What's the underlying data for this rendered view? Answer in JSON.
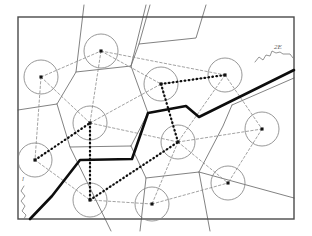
{
  "figure": {
    "kind": "geometric-diagram",
    "width": 312,
    "height": 236,
    "background_color": "#ffffff",
    "frame": {
      "label": "bounding-frame",
      "x": 18,
      "y": 17,
      "width": 276,
      "height": 202,
      "stroke_color": "#4a4a4a"
    },
    "styles": {
      "voronoi_edge_color": "#6b6b6b",
      "delaunay_edge_color": "#8a8a8a",
      "circle_color": "#7d7d7d",
      "node_color": "#111111",
      "thick_path_color": "#0d0d0d"
    },
    "nodes": [
      {
        "id": "n1",
        "label": "node-upper-left",
        "x": 41,
        "y": 77,
        "r": 17
      },
      {
        "id": "n2",
        "label": "node-top",
        "x": 101,
        "y": 51,
        "r": 17
      },
      {
        "id": "n3",
        "label": "node-mid-left",
        "x": 90,
        "y": 123,
        "r": 17
      },
      {
        "id": "n4",
        "label": "node-upper-center",
        "x": 161,
        "y": 84,
        "r": 17
      },
      {
        "id": "n5",
        "label": "node-upper-right",
        "x": 225,
        "y": 75,
        "r": 17
      },
      {
        "id": "n6",
        "label": "node-center",
        "x": 178,
        "y": 142,
        "r": 17
      },
      {
        "id": "n7",
        "label": "node-far-right",
        "x": 262,
        "y": 129,
        "r": 17
      },
      {
        "id": "n8",
        "label": "node-left-lower",
        "x": 35,
        "y": 160,
        "r": 17
      },
      {
        "id": "n9",
        "label": "node-bottom-left",
        "x": 90,
        "y": 200,
        "r": 17
      },
      {
        "id": "n10",
        "label": "node-bottom-center",
        "x": 152,
        "y": 204,
        "r": 17
      },
      {
        "id": "n11",
        "label": "node-lower-right",
        "x": 228,
        "y": 183,
        "r": 17
      }
    ],
    "delaunay_edges": [
      {
        "from": "n1",
        "to": "n2"
      },
      {
        "from": "n1",
        "to": "n3"
      },
      {
        "from": "n1",
        "to": "n8"
      },
      {
        "from": "n2",
        "to": "n3"
      },
      {
        "from": "n2",
        "to": "n4"
      },
      {
        "from": "n3",
        "to": "n4"
      },
      {
        "from": "n3",
        "to": "n8"
      },
      {
        "from": "n3",
        "to": "n9"
      },
      {
        "from": "n3",
        "to": "n6"
      },
      {
        "from": "n4",
        "to": "n5"
      },
      {
        "from": "n4",
        "to": "n6"
      },
      {
        "from": "n5",
        "to": "n6"
      },
      {
        "from": "n5",
        "to": "n7"
      },
      {
        "from": "n6",
        "to": "n7"
      },
      {
        "from": "n6",
        "to": "n10"
      },
      {
        "from": "n6",
        "to": "n11"
      },
      {
        "from": "n6",
        "to": "n9"
      },
      {
        "from": "n7",
        "to": "n11"
      },
      {
        "from": "n8",
        "to": "n9"
      },
      {
        "from": "n9",
        "to": "n10"
      },
      {
        "from": "n10",
        "to": "n11"
      },
      {
        "from": "n2",
        "to": "n5"
      }
    ],
    "voronoi_edges": [
      {
        "label": "vedge-top-left",
        "points": "18,110 57,104 76,72 84,5"
      },
      {
        "label": "vedge-top-mid",
        "points": "76,72 131,66 146,5"
      },
      {
        "label": "vedge-upper-right",
        "points": "131,66 139,44 150,5"
      },
      {
        "label": "vedge-right-upper",
        "points": "139,44 196,38 206,5"
      },
      {
        "label": "vedge-center-a",
        "points": "57,104 70,147 131,146"
      },
      {
        "label": "vedge-center-b",
        "points": "131,146 148,113 131,66"
      },
      {
        "label": "vedge-lower-left",
        "points": "70,147 111,231"
      },
      {
        "label": "vedge-lower-mid",
        "points": "131,146 146,178 140,231"
      },
      {
        "label": "vedge-lower-mid-2",
        "points": "146,178 199,172 210,231"
      },
      {
        "label": "vedge-right-mid",
        "points": "199,172 223,126 232,105"
      },
      {
        "label": "vedge-right-out",
        "points": "199,172 294,198"
      },
      {
        "label": "vedge-right-far",
        "points": "232,105 294,78"
      }
    ],
    "thick_path": {
      "label": "thick-boundary-path",
      "points": "30,219 52,196 80,160 132,159 148,113 186,106 199,117 294,70",
      "stroke_width": 2.6
    },
    "thick_dotted_path": {
      "label": "thick-dotted-tour",
      "points": "35,160 90,123 90,200 161,84 178,142 225,75 161,84",
      "segments": [
        {
          "from": "n8",
          "to": "n3"
        },
        {
          "from": "n3",
          "to": "n9"
        },
        {
          "from": "n9",
          "to": "n6"
        },
        {
          "from": "n6",
          "to": "n4"
        },
        {
          "from": "n4",
          "to": "n5"
        }
      ],
      "stroke_width": 2.3
    },
    "annotations": [
      {
        "id": "a1",
        "label": "annotation-top-right",
        "text": "2E",
        "x": 274,
        "y": 49,
        "squiggle": "255,62 259,57 263,60 266,55 270,56 272,51 276,53 280,52 283,54 290,54 293,58"
      },
      {
        "id": "a2",
        "label": "annotation-bottom-left",
        "text": "l",
        "x": 22,
        "y": 181,
        "squiggle": "24,186 21,191 25,196 21,201 25,206 22,211 26,215 24,219"
      }
    ]
  }
}
